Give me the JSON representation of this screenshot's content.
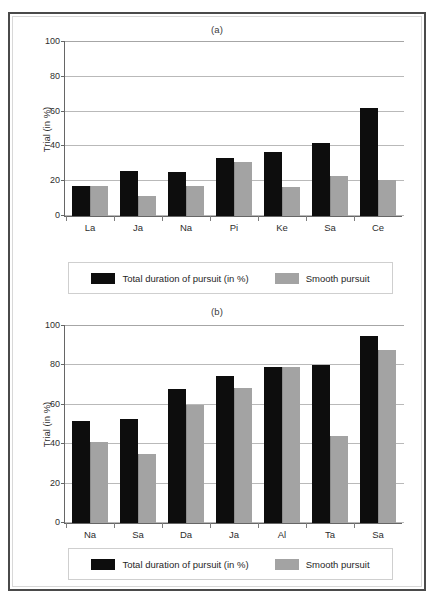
{
  "figure": {
    "background_color": "#ffffff",
    "frame_color": "#4a4a4a",
    "series_colors": {
      "total_duration": "#0d0d0d",
      "smooth_pursuit": "#a3a3a3"
    }
  },
  "legend": {
    "total_duration_label": "Total duration of pursuit (in %)",
    "smooth_pursuit_label": "Smooth pursuit"
  },
  "chart_data": [
    {
      "type": "bar",
      "title": "(a)",
      "xlabel": "",
      "ylabel": "Trial (in %)",
      "ylim": [
        0,
        100
      ],
      "yticks": [
        0,
        20,
        40,
        60,
        80,
        100
      ],
      "ytick_labels": [
        "0",
        "20",
        "40",
        "60",
        "80",
        "100"
      ],
      "grid": true,
      "legend_position": "below",
      "categories": [
        "La",
        "Ja",
        "Na",
        "Pi",
        "Ke",
        "Sa",
        "Ce"
      ],
      "series": [
        {
          "name": "Total duration of pursuit (in %)",
          "color": "#0d0d0d",
          "values": [
            17,
            26,
            25.5,
            33.5,
            37,
            42,
            62
          ]
        },
        {
          "name": "Smooth pursuit",
          "color": "#a3a3a3",
          "values": [
            17,
            11.5,
            17,
            31,
            16.5,
            23,
            20.5
          ]
        }
      ]
    },
    {
      "type": "bar",
      "title": "(b)",
      "xlabel": "",
      "ylabel": "Trial (in %)",
      "ylim": [
        0,
        100
      ],
      "yticks": [
        0,
        20,
        40,
        60,
        80,
        100
      ],
      "ytick_labels": [
        "0",
        "20",
        "40",
        "60",
        "80",
        "100"
      ],
      "grid": true,
      "legend_position": "below",
      "categories": [
        "Na",
        "Sa",
        "Da",
        "Ja",
        "Al",
        "Ta",
        "Sa"
      ],
      "series": [
        {
          "name": "Total duration of pursuit (in %)",
          "color": "#0d0d0d",
          "values": [
            52,
            53,
            68,
            74.5,
            79,
            80,
            95
          ]
        },
        {
          "name": "Smooth pursuit",
          "color": "#a3a3a3",
          "values": [
            41,
            35,
            60,
            68.5,
            79,
            44,
            88
          ]
        }
      ]
    }
  ]
}
